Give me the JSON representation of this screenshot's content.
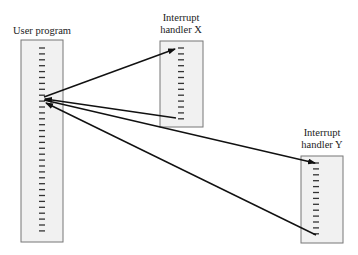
{
  "diagram": {
    "type": "interrupt-flow",
    "boxes": [
      {
        "id": "user",
        "label_lines": [
          "User program"
        ],
        "ticks": 32
      },
      {
        "id": "hx",
        "label_lines": [
          "Interrupt",
          "handler X"
        ],
        "ticks": 13
      },
      {
        "id": "hy",
        "label_lines": [
          "Interrupt",
          "handler Y"
        ],
        "ticks": 13
      }
    ],
    "arrows": [
      {
        "from": "user",
        "to": "hx",
        "direction": "user-to-handler-X-start"
      },
      {
        "from": "hx",
        "to": "user",
        "direction": "handler-X-end-to-user"
      },
      {
        "from": "user",
        "to": "hy",
        "direction": "user-to-handler-Y-start"
      },
      {
        "from": "hy",
        "to": "user",
        "direction": "handler-Y-end-to-user"
      }
    ],
    "colors": {
      "box_fill": "#f1f1f1",
      "box_stroke": "#777777",
      "line": "#111111"
    }
  }
}
